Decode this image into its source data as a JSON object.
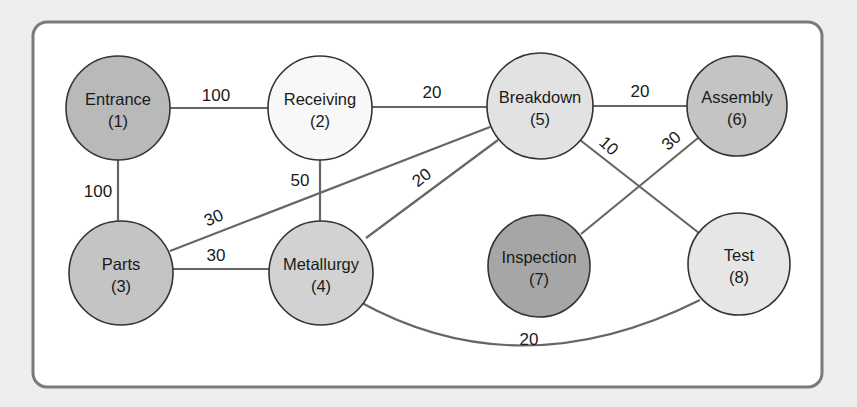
{
  "diagram": {
    "type": "relationship-graph",
    "colors": {
      "background": "#eeeeee",
      "panel": "#ffffff",
      "panel_border": "#7a7a7a",
      "edge": "#666666",
      "node_stroke": "#333333",
      "dark_node": "#a9a9a9",
      "mid_node": "#c6c6c6",
      "light_node": "#e4e4e4",
      "white_node": "#f9f9f9"
    },
    "nodes": [
      {
        "id": 1,
        "name": "Entrance",
        "num": "(1)",
        "cx": 118,
        "cy": 108,
        "r": 52,
        "fill": "#b9b9b9"
      },
      {
        "id": 2,
        "name": "Receiving",
        "num": "(2)",
        "cx": 320,
        "cy": 108,
        "r": 52,
        "fill": "#f8f8f8"
      },
      {
        "id": 3,
        "name": "Parts",
        "num": "(3)",
        "cx": 121,
        "cy": 273,
        "r": 52,
        "fill": "#c4c4c4"
      },
      {
        "id": 4,
        "name": "Metallurgy",
        "num": "(4)",
        "cx": 321,
        "cy": 273,
        "r": 52,
        "fill": "#d2d2d2"
      },
      {
        "id": 5,
        "name": "Breakdown",
        "num": "(5)",
        "cx": 540,
        "cy": 106,
        "r": 53,
        "fill": "#e2e2e2"
      },
      {
        "id": 6,
        "name": "Assembly",
        "num": "(6)",
        "cx": 737,
        "cy": 106,
        "r": 50,
        "fill": "#c4c4c4"
      },
      {
        "id": 7,
        "name": "Inspection",
        "num": "(7)",
        "cx": 539,
        "cy": 266,
        "r": 51,
        "fill": "#a6a6a6"
      },
      {
        "id": 8,
        "name": "Test",
        "num": "(8)",
        "cx": 739,
        "cy": 264,
        "r": 51,
        "fill": "#e6e6e6"
      }
    ],
    "edges": [
      {
        "from": 1,
        "to": 2,
        "weight": "100",
        "lx": 216,
        "ly": 101,
        "rot": 0
      },
      {
        "from": 2,
        "to": 5,
        "weight": "20",
        "lx": 432,
        "ly": 98,
        "rot": 0
      },
      {
        "from": 5,
        "to": 6,
        "weight": "20",
        "lx": 640,
        "ly": 97,
        "rot": 0
      },
      {
        "from": 1,
        "to": 3,
        "weight": "100",
        "lx": 98,
        "ly": 197,
        "rot": 0
      },
      {
        "from": 2,
        "to": 4,
        "weight": "50",
        "lx": 300,
        "ly": 186,
        "rot": 0
      },
      {
        "from": 3,
        "to": 5,
        "weight": "30",
        "lx": 216,
        "ly": 223,
        "rot": -24
      },
      {
        "from": 4,
        "to": 5,
        "weight": "20",
        "lx": 425,
        "ly": 182,
        "rot": -37
      },
      {
        "from": 3,
        "to": 4,
        "weight": "30",
        "lx": 216,
        "ly": 261,
        "rot": 0
      },
      {
        "from": 5,
        "to": 8,
        "weight": "10",
        "lx": 605,
        "ly": 150,
        "rot": 42
      },
      {
        "from": 7,
        "to": 6,
        "weight": "30",
        "lx": 675,
        "ly": 145,
        "rot": -42
      },
      {
        "from": 4,
        "to": 8,
        "weight": "20",
        "lx": 529,
        "ly": 345,
        "rot": 0,
        "curved": true
      }
    ]
  }
}
